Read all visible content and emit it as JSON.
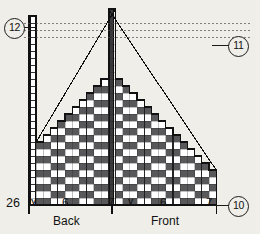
{
  "background_color": "#efeee8",
  "callouts": [
    {
      "id": "callout-12",
      "label": "12",
      "x": 4,
      "y": 18,
      "leader": {
        "x": 23,
        "y": 27,
        "w": 12
      }
    },
    {
      "id": "callout-11",
      "label": "11",
      "x": 228,
      "y": 36,
      "leader": {
        "x": 212,
        "y": 45,
        "w": 17
      }
    },
    {
      "id": "callout-10",
      "label": "10",
      "x": 228,
      "y": 196,
      "leader": {
        "x": 212,
        "y": 205,
        "w": 17
      }
    }
  ],
  "axis": {
    "left_label": "26",
    "ticks": [
      {
        "label": "6",
        "x": 62
      },
      {
        "label": "7",
        "x": 108
      },
      {
        "label": "6",
        "x": 160
      },
      {
        "label": "7",
        "x": 206
      }
    ],
    "sections": [
      {
        "label": "Back",
        "x": 62
      },
      {
        "label": "Front",
        "x": 160
      }
    ],
    "v_marks": [
      {
        "x": 31
      },
      {
        "x": 128
      }
    ]
  },
  "chart_data": {
    "type": "heatmap",
    "xlabel": "",
    "ylabel": "",
    "grid": true,
    "legend_position": "none",
    "cell_width": 7.2,
    "cell_height": 7.0,
    "origin_x": 29,
    "origin_y": 205,
    "n_cols": 26,
    "n_rows": 28,
    "colors": {
      "purl": "#58585a",
      "knit": "#ffffff",
      "gridline": "#1b1b1b",
      "guide": "#4a4a4a",
      "outline": "#111111",
      "seam": "#3a3a3c"
    },
    "annotations": [
      "two symmetric staircase decrease edges with diagonal slope lines",
      "tall narrow seam column at centre extending above the fabric",
      "narrow empty selvedge column at the far left extending above the fabric",
      "three horizontal dotted guide lines across the upper region"
    ],
    "guide_rows": [
      24,
      25,
      26
    ],
    "column_heights": [
      27,
      9,
      10,
      11,
      12,
      13,
      14,
      15,
      16,
      17,
      18,
      28,
      18,
      17,
      16,
      15,
      14,
      13,
      12,
      11,
      10,
      9,
      8,
      7,
      6,
      5
    ],
    "rib_period": 4,
    "rib_dark_offset": 0,
    "categories": [
      "col1",
      "col2",
      "col3",
      "col4",
      "col5",
      "col6",
      "col7",
      "col8",
      "col9",
      "col10",
      "col11",
      "col12",
      "col13",
      "col14",
      "col15",
      "col16",
      "col17",
      "col18",
      "col19",
      "col20",
      "col21",
      "col22",
      "col23",
      "col24",
      "col25",
      "col26"
    ],
    "values": [
      27,
      9,
      10,
      11,
      12,
      13,
      14,
      15,
      16,
      17,
      18,
      28,
      18,
      17,
      16,
      15,
      14,
      13,
      12,
      11,
      10,
      9,
      8,
      7,
      6,
      5
    ]
  }
}
